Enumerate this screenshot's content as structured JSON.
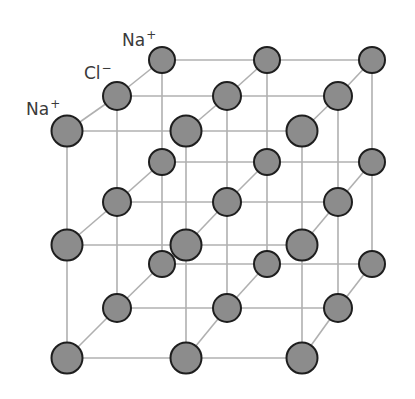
{
  "labels": [
    {
      "id": "na-top",
      "element": "Na",
      "charge": "+",
      "x": 122,
      "y": 32
    },
    {
      "id": "cl",
      "element": "Cl",
      "charge": "−",
      "x": 84,
      "y": 65
    },
    {
      "id": "na-left",
      "element": "Na",
      "charge": "+",
      "x": 26,
      "y": 101
    }
  ],
  "colors": {
    "atom_fill": "#8c8c8c",
    "atom_stroke": "#1e1e1e",
    "bond_line": "#b0b0b0",
    "label_text": "#3a3a3a"
  },
  "lattice": {
    "size": 3,
    "planes": [
      {
        "name": "back",
        "x": [
          162,
          267,
          372
        ],
        "y": [
          60,
          162,
          264
        ],
        "r": 13
      },
      {
        "name": "middle",
        "x": [
          117,
          227,
          338
        ],
        "y": [
          96,
          202,
          308
        ],
        "r": 14
      },
      {
        "name": "front",
        "x": [
          67,
          186,
          302
        ],
        "y": [
          131,
          245,
          358
        ],
        "r": 15.5
      }
    ]
  }
}
